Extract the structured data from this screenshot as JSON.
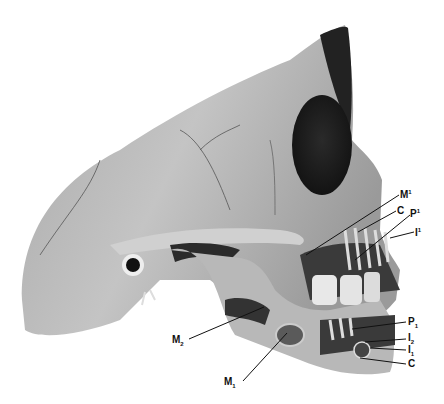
{
  "figure": {
    "labels": {
      "upper": [
        {
          "id": "M1_upper",
          "base": "M",
          "mark": "1",
          "pos": "sup"
        },
        {
          "id": "C_upper",
          "base": "C",
          "mark": "",
          "pos": "none"
        },
        {
          "id": "P1_upper",
          "base": "P",
          "mark": "1",
          "pos": "sup"
        },
        {
          "id": "I1_upper",
          "base": "I",
          "mark": "1",
          "pos": "sup"
        }
      ],
      "lower": [
        {
          "id": "P1_lower",
          "base": "P",
          "mark": "1",
          "pos": "sub"
        },
        {
          "id": "I2_lower",
          "base": "I",
          "mark": "2",
          "pos": "sub"
        },
        {
          "id": "I1_lower",
          "base": "I",
          "mark": "1",
          "pos": "sub"
        },
        {
          "id": "C_lower",
          "base": "C",
          "mark": "",
          "pos": "none"
        },
        {
          "id": "M2_lower",
          "base": "M",
          "mark": "2",
          "pos": "sub"
        },
        {
          "id": "M1_lower",
          "base": "M",
          "mark": "1",
          "pos": "sub"
        }
      ]
    },
    "colors": {
      "bone": "#bdbdbd",
      "shadow": "#3a3a3a",
      "dark": "#1a1a1a",
      "teeth": "#e8e8e8",
      "bg": "#ffffff"
    }
  }
}
